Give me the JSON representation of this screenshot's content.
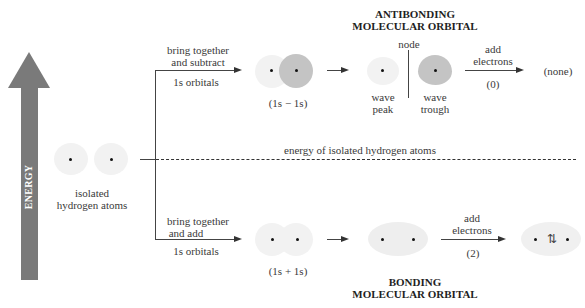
{
  "energy_axis": {
    "label": "ENERGY",
    "color": "#7a7a7a"
  },
  "isolated": {
    "label_line1": "isolated",
    "label_line2": "hydrogen atoms"
  },
  "reference_line": {
    "label": "energy of isolated hydrogen atoms"
  },
  "antibonding": {
    "title_line1": "ANTIBONDING",
    "title_line2": "MOLECULAR ORBITAL",
    "step1_line1": "bring together",
    "step1_line2": "and subtract",
    "step1_sub": "1s orbitals",
    "combo_label": "(1s − 1s)",
    "node_label": "node",
    "peak_line1": "wave",
    "peak_line2": "peak",
    "trough_line1": "wave",
    "trough_line2": "trough",
    "add_line1": "add",
    "add_line2": "electrons",
    "count": "(0)",
    "result": "(none)"
  },
  "bonding": {
    "title_line1": "BONDING",
    "title_line2": "MOLECULAR ORBITAL",
    "step1_line1": "bring together",
    "step1_line2": "and add",
    "step1_sub": "1s orbitals",
    "combo_label": "(1s + 1s)",
    "add_line1": "add",
    "add_line2": "electrons",
    "count": "(2)",
    "electron_pair": "⇅"
  },
  "colors": {
    "light_orbital": "#f2f2f2",
    "dark_orbital": "#c4c4c4",
    "arrow": "#7a7a7a"
  }
}
